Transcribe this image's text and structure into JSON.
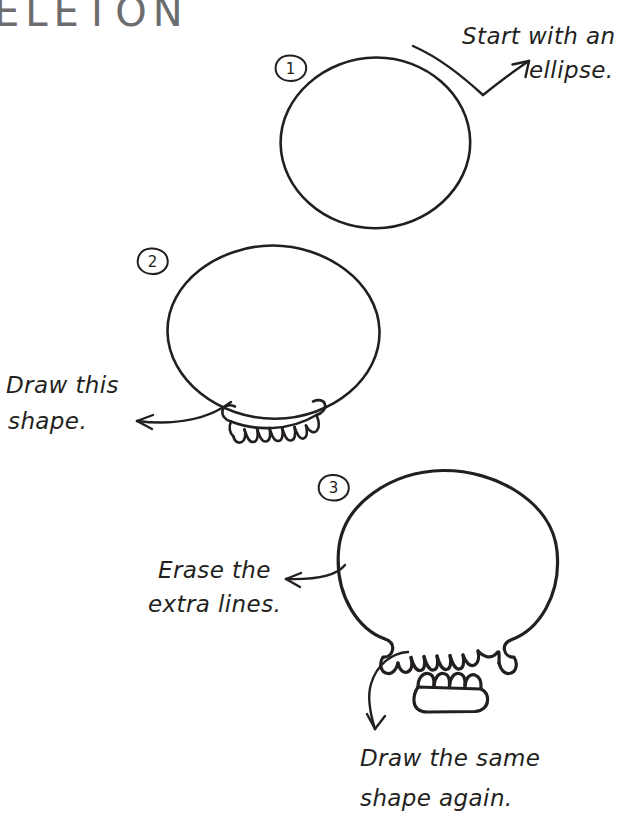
{
  "page": {
    "title_partial": "ELETON",
    "background_color": "#ffffff",
    "ink_color": "#231f20"
  },
  "steps": [
    {
      "number": "1",
      "marker_label": "1",
      "shape_name": "ellipse",
      "annotation": {
        "line1": "Start with an",
        "line2": "ellipse.",
        "arrow": "curved-arrow-up-right"
      }
    },
    {
      "number": "2",
      "marker_label": "2",
      "shape_name": "ellipse-with-tooth-row",
      "annotation": {
        "line1": "Draw this",
        "line2": "shape.",
        "arrow": "curved-arrow-left"
      }
    },
    {
      "number": "3",
      "marker_label": "3",
      "shape_name": "skull-with-lower-jaw",
      "annotation": {
        "line1": "Erase the",
        "line2": "extra lines.",
        "arrow": "curved-arrow-left"
      },
      "annotation2": {
        "line1": "Draw the same",
        "line2": "shape again.",
        "arrow": "curved-arrow-down-left"
      }
    }
  ]
}
